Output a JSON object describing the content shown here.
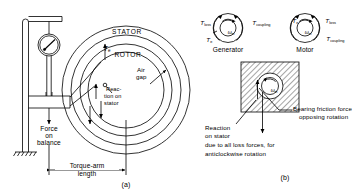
{
  "figure": {
    "type": "engineering-line-drawing",
    "ink_color": "#000000",
    "background_color": "#ffffff"
  },
  "panel_a": {
    "id": "(a)",
    "caption": "Dynamometer with torque arm and spring balance",
    "labels": {
      "stator": "STATOR",
      "rotor": "ROTOR",
      "air_gap_line1": "Air",
      "air_gap_line2": "gap",
      "reaction_line1": "Reac-",
      "reaction_line2": "tion on",
      "reaction_line3": "stator",
      "force_line1": "Force",
      "force_line2": "on",
      "force_line3": "balance",
      "torque_arm_line1": "Torque-arm",
      "torque_arm_line2": "length",
      "torque_symbol": "T",
      "torque_subscript": "e"
    },
    "components": [
      "support-post",
      "ground-hatching",
      "overhead-bracket",
      "dial-spring-balance",
      "stator-outer-circle",
      "stator-inner-circle",
      "rotor-outer-circle",
      "rotor-inner-circle",
      "air-gap-leader",
      "torque-arm-dimension"
    ]
  },
  "panel_b": {
    "id": "(b)",
    "caption": "Torque components for generator and motor operation",
    "generator": {
      "name": "Generator",
      "omega": "ω",
      "omega_subscript": "m",
      "torques": [
        {
          "symbol": "T",
          "subscript": "loss",
          "position": "top-left"
        },
        {
          "symbol": "T",
          "subscript": "e",
          "position": "left"
        },
        {
          "symbol": "T",
          "subscript": "coupling",
          "position": "top-right"
        }
      ]
    },
    "motor": {
      "name": "Motor",
      "omega": "ω",
      "omega_subscript": "m",
      "torques": [
        {
          "symbol": "T",
          "subscript": "e",
          "position": "top-left"
        },
        {
          "symbol": "T",
          "subscript": "loss",
          "position": "top-right"
        },
        {
          "symbol": "T",
          "subscript": "coupling",
          "position": "right"
        }
      ]
    },
    "bearing": {
      "omega": "ω",
      "omega_subscript": "m",
      "friction_line1": "Bearing friction force",
      "friction_line2": "opposing rotation",
      "reaction_line1": "Reaction",
      "reaction_line2": "on stator",
      "reaction_line3": "due to all loss forces, for",
      "reaction_line4": "anticlockwise rotation"
    }
  }
}
